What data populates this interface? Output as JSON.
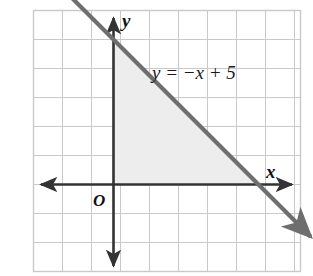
{
  "figure": {
    "background_color": "#ffffff"
  },
  "colors": {
    "grid": "#c9c9c9",
    "frame": "#c9c9c9",
    "axis": "#333333",
    "line": "#6e6e6e",
    "shade": "#ededed",
    "text": "#111111"
  },
  "labels": {
    "equation": "y = −x + 5",
    "x_axis": "x",
    "y_axis": "y",
    "origin": "O"
  },
  "chart_data": {
    "type": "line",
    "title": "",
    "xlabel": "x",
    "ylabel": "y",
    "equation": "y = -x + 5",
    "slope": -1,
    "y_intercept": 5,
    "x_intercept": 5,
    "xlim": [
      -4,
      7
    ],
    "ylim": [
      -3,
      7
    ],
    "grid": true,
    "grid_spacing": 1,
    "legend": "none",
    "series": [
      {
        "name": "y = -x + 5",
        "type": "line",
        "color": "#6e6e6e",
        "arrows": "both",
        "points": [
          {
            "x": -2.5,
            "y": 7.5
          },
          {
            "x": 0,
            "y": 5
          },
          {
            "x": 5,
            "y": 0
          },
          {
            "x": 6.8,
            "y": -1.8
          }
        ]
      }
    ],
    "shaded_region": {
      "name": "triangle bounded by axes and the line",
      "color": "#ededed",
      "vertices": [
        {
          "x": 0,
          "y": 0
        },
        {
          "x": 0,
          "y": 5
        },
        {
          "x": 5,
          "y": 0
        }
      ]
    },
    "annotations": [
      {
        "text": "y = −x + 5",
        "x": 1.5,
        "y": 5.8
      },
      {
        "text": "O",
        "x": -0.55,
        "y": -0.65
      },
      {
        "text": "x",
        "x": 6.35,
        "y": 0.55
      },
      {
        "text": "y",
        "x": 0.45,
        "y": 7.1
      }
    ]
  }
}
